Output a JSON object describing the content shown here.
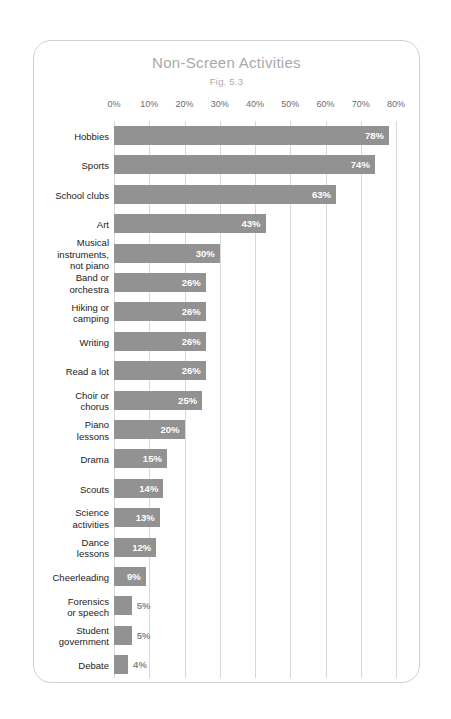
{
  "chart_data": {
    "type": "bar",
    "orientation": "horizontal",
    "title": "Non-Screen Activities",
    "subtitle": "Fig. 5.3",
    "xlabel": "",
    "ylabel": "",
    "xlim": [
      0,
      80
    ],
    "xticks": [
      0,
      10,
      20,
      30,
      40,
      50,
      60,
      70,
      80
    ],
    "xtick_labels": [
      "0%",
      "10%",
      "20%",
      "30%",
      "40%",
      "50%",
      "60%",
      "70%",
      "80%"
    ],
    "grid": true,
    "legend": null,
    "bar_color": "#929292",
    "value_label_color_inside": "#ffffff",
    "value_label_color_outside": "#8a8a8a",
    "categories": [
      "Hobbies",
      "Sports",
      "School clubs",
      "Art",
      "Musical\ninstruments,\nnot piano",
      "Band or\norchestra",
      "Hiking or\ncamping",
      "Writing",
      "Read a lot",
      "Choir or\nchorus",
      "Piano\nlessons",
      "Drama",
      "Scouts",
      "Science\nactivities",
      "Dance\nlessons",
      "Cheerleading",
      "Forensics\nor speech",
      "Student\ngovernment",
      "Debate"
    ],
    "values": [
      78,
      74,
      63,
      43,
      30,
      26,
      26,
      26,
      26,
      25,
      20,
      15,
      14,
      13,
      12,
      9,
      5,
      5,
      4
    ],
    "value_labels": [
      "78%",
      "74%",
      "63%",
      "43%",
      "30%",
      "26%",
      "26%",
      "26%",
      "26%",
      "25%",
      "20%",
      "15%",
      "14%",
      "13%",
      "12%",
      "9%",
      "5%",
      "5%",
      "4%"
    ]
  }
}
